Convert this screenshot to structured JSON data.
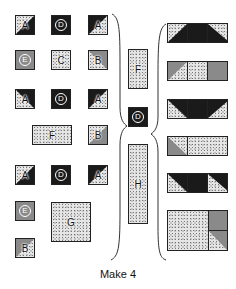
{
  "caption": "Make 4",
  "labels": {
    "A": "A",
    "B": "B",
    "C": "C",
    "D": "D",
    "E": "E",
    "F": "F",
    "G": "G",
    "H": "H"
  },
  "colors": {
    "dark": "#1a1a1a",
    "gray": "#8a8a8a",
    "speckled": "#e6e6e6",
    "outline": "#222222"
  },
  "left_pieces": [
    {
      "row": 1,
      "pieces": [
        "A",
        "D",
        "A"
      ]
    },
    {
      "row": 2,
      "pieces": [
        "E",
        "C",
        "B"
      ]
    },
    {
      "row": 3,
      "pieces": [
        "A",
        "D",
        "A"
      ]
    },
    {
      "row": 4,
      "pieces": [
        "F",
        "B"
      ]
    },
    {
      "row": 5,
      "pieces": [
        "A",
        "D",
        "A"
      ]
    },
    {
      "row": 6,
      "pieces": [
        "E",
        "G"
      ]
    },
    {
      "row": 7,
      "pieces": [
        "B"
      ]
    }
  ],
  "middle_pieces": [
    "F",
    "D",
    "H"
  ],
  "right_units": [
    "A-D-A row (dark)",
    "B-C-E row",
    "A-D-A row (dark)",
    "B-F row",
    "A-D-A row (dark)",
    "G with E and B"
  ]
}
